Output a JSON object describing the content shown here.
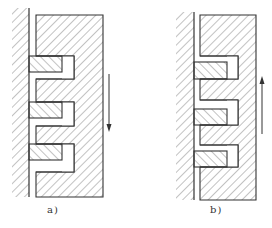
{
  "figure": {
    "panels": [
      {
        "id": "a",
        "caption": "a)",
        "motion_direction": "down",
        "description": "Stepped block with three sliding pistons; arrow pointing downward"
      },
      {
        "id": "b",
        "caption": "b)",
        "motion_direction": "up",
        "description": "Stepped block with three sliding pistons; arrow pointing upward"
      }
    ],
    "colors": {
      "line": "#333333",
      "hatch": "#555555",
      "background": "#ffffff"
    }
  }
}
